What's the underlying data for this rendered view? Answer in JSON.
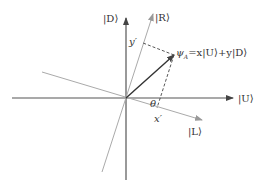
{
  "diagram": {
    "axes": {
      "U": {
        "label": "|U⟩"
      },
      "D": {
        "label": "|D⟩"
      },
      "R": {
        "label": "|R⟩"
      },
      "L": {
        "label": "|L⟩"
      }
    },
    "vector": {
      "label_psi": "ψ",
      "label_sub": "A",
      "label_rest": "=x|U⟩+y|D⟩"
    },
    "projections": {
      "x_prime": "x′",
      "y_prime": "y′"
    },
    "angle": {
      "label": "θ"
    },
    "colors": {
      "axis": "#555555",
      "rotated_axis": "#aaaaaa",
      "vector": "#333333",
      "dashed": "#444444"
    }
  }
}
